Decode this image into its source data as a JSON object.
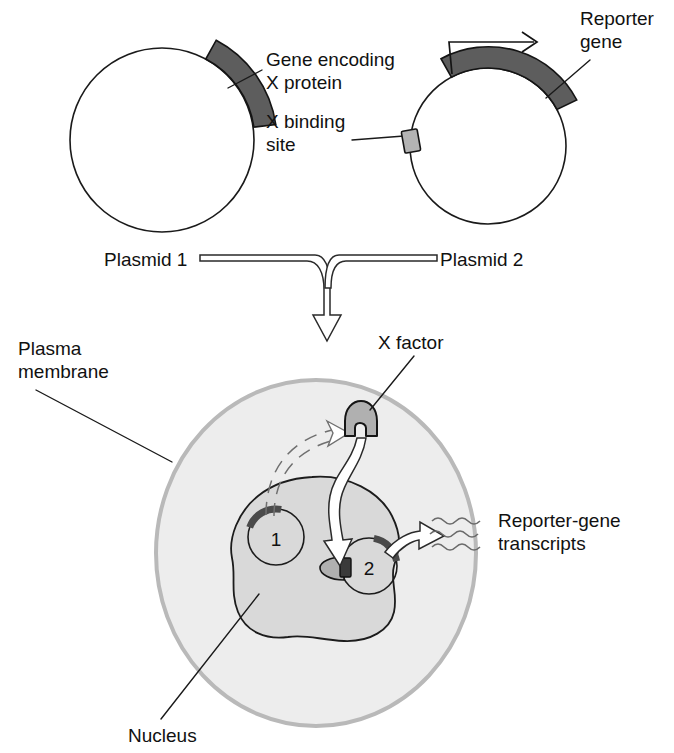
{
  "figure": {
    "background_color": "#ffffff"
  },
  "colors": {
    "gene_arc_fill": "#5d5d5d",
    "binding_site_fill": "#b3b3b3",
    "cell_fill": "#ededed",
    "cell_border": "#b9b9b9",
    "nucleus_fill": "#d9d9d9",
    "nucleus_border": "#1c1c1c",
    "x_factor_fill": "#b0b0b0",
    "outline": "#1a1a1a",
    "transcript_stroke": "#6a6a6a"
  },
  "top_panel": {
    "plasmid1": {
      "name_label": "Plasmid 1",
      "gene_label_line1": "Gene encoding",
      "gene_label_line2": "X protein"
    },
    "plasmid2": {
      "name_label": "Plasmid 2",
      "binding_site_label_line1": "X binding",
      "binding_site_label_line2": "site",
      "reporter_label_line1": "Reporter",
      "reporter_label_line2": "gene",
      "promoter_icon": "bent-arrow-promoter-icon"
    }
  },
  "bottom_panel": {
    "plasma_membrane_label_line1": "Plasma",
    "plasma_membrane_label_line2": "membrane",
    "nucleus_label": "Nucleus",
    "x_factor_label": "X factor",
    "transcripts_label_line1": "Reporter-gene",
    "transcripts_label_line2": "transcripts",
    "nuclear_plasmid1_number": "1",
    "nuclear_plasmid2_number": "2"
  },
  "icons": {
    "merge_arrow": "down-arrow-icon",
    "translation_arrow": "dashed-arrow-icon",
    "binding_arrow": "curved-arrow-icon",
    "transcription_arrow": "curved-arrow-icon",
    "transcript_squiggle": "wavy-rna-icon"
  }
}
